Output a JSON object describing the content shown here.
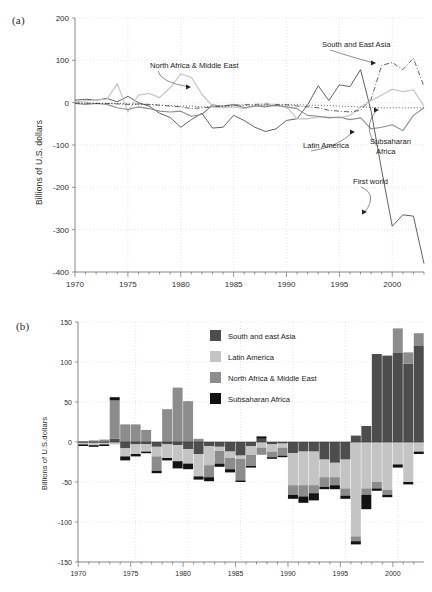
{
  "figure": {
    "panels": [
      {
        "id": "a",
        "label": "(a)",
        "ylabel": "Billions of U.S. dollars"
      },
      {
        "id": "b",
        "label": "(b)",
        "ylabel": "Billions of U.S.dollars"
      }
    ]
  },
  "chart_data": [
    {
      "type": "line",
      "panel": "(a)",
      "title": "",
      "xlabel": "",
      "ylabel": "Billions of U.S. dollars",
      "xlim": [
        1970,
        2003
      ],
      "ylim": [
        -400,
        200
      ],
      "yticks": [
        -400,
        -300,
        -200,
        -100,
        0,
        100,
        200
      ],
      "xticks": [
        1970,
        1975,
        1980,
        1985,
        1990,
        1995,
        2000
      ],
      "grid": true,
      "legend_position": "annotations-inline",
      "annotations": [
        {
          "text": "North Africa & Middle East",
          "x": 1979,
          "y": 45
        },
        {
          "text": "South and East Asia",
          "x": 1997.5,
          "y": 102
        },
        {
          "text": "Latin America",
          "x": 1996,
          "y": -63
        },
        {
          "text": "Subsaharan Africa",
          "x": 2000.5,
          "y": -12
        },
        {
          "text": "First world",
          "x": 2000,
          "y": -247
        }
      ],
      "x": [
        1970,
        1971,
        1972,
        1973,
        1974,
        1975,
        1976,
        1977,
        1978,
        1979,
        1980,
        1981,
        1982,
        1983,
        1984,
        1985,
        1986,
        1987,
        1988,
        1989,
        1990,
        1991,
        1992,
        1993,
        1994,
        1995,
        1996,
        1997,
        1998,
        1999,
        2000,
        2001,
        2002,
        2003
      ],
      "series": [
        {
          "name": "First world",
          "style": "solid",
          "values": [
            6,
            8,
            6,
            10,
            2,
            15,
            0,
            -8,
            -25,
            -35,
            -58,
            -40,
            -25,
            -60,
            -58,
            -30,
            -42,
            -58,
            -68,
            -62,
            -42,
            -38,
            -5,
            40,
            5,
            42,
            38,
            78,
            -20,
            -160,
            -292,
            -265,
            -268,
            -380
          ]
        },
        {
          "name": "North Africa & Middle East",
          "style": "solid-light",
          "values": [
            2,
            4,
            6,
            8,
            45,
            -22,
            18,
            22,
            12,
            35,
            68,
            60,
            20,
            -8,
            -12,
            -10,
            -14,
            -8,
            -5,
            -8,
            -10,
            -38,
            -38,
            -34,
            -34,
            -36,
            -30,
            -10,
            5,
            18,
            32,
            26,
            30,
            -8
          ]
        },
        {
          "name": "Latin America",
          "style": "solid-gray",
          "values": [
            -2,
            -4,
            -2,
            -4,
            -12,
            -16,
            -10,
            -14,
            -20,
            -22,
            -20,
            -32,
            -28,
            -5,
            -8,
            -4,
            -12,
            -8,
            -10,
            -6,
            -10,
            -14,
            -30,
            -32,
            -36,
            -34,
            -40,
            -36,
            -62,
            -58,
            -52,
            -66,
            -30,
            -12
          ]
        },
        {
          "name": "South and East Asia",
          "style": "dashdot",
          "values": [
            -1,
            -1,
            -2,
            -2,
            -3,
            -4,
            -3,
            -4,
            -6,
            -8,
            -10,
            -14,
            -12,
            -10,
            -8,
            -6,
            -5,
            -4,
            -3,
            -4,
            -5,
            -8,
            -10,
            -12,
            -18,
            -20,
            -22,
            -18,
            8,
            88,
            95,
            78,
            105,
            38
          ]
        },
        {
          "name": "Subsaharan Africa",
          "style": "dotted",
          "values": [
            -1,
            -1,
            -1,
            -2,
            -2,
            -3,
            -4,
            -5,
            -6,
            -7,
            -8,
            -8,
            -10,
            -10,
            -9,
            -8,
            -7,
            -6,
            -6,
            -6,
            -5,
            -5,
            -6,
            -6,
            -7,
            -8,
            -9,
            -10,
            -11,
            -12,
            -12,
            -12,
            -12,
            -12
          ]
        }
      ]
    },
    {
      "type": "bar",
      "subtype": "stacked",
      "panel": "(b)",
      "title": "",
      "xlabel": "",
      "ylabel": "Billions of U.S.dollars",
      "xlim": [
        1970,
        2002
      ],
      "ylim": [
        -150,
        150
      ],
      "yticks": [
        -150,
        -100,
        -50,
        0,
        50,
        100,
        150
      ],
      "xticks": [
        1970,
        1975,
        1980,
        1985,
        1990,
        1995,
        2000
      ],
      "grid": true,
      "legend_position": "top-center",
      "categories": [
        1970,
        1971,
        1972,
        1973,
        1974,
        1975,
        1976,
        1977,
        1978,
        1979,
        1980,
        1981,
        1982,
        1983,
        1984,
        1985,
        1986,
        1987,
        1988,
        1989,
        1990,
        1991,
        1992,
        1993,
        1994,
        1995,
        1996,
        1997,
        1998,
        1999,
        2000,
        2001,
        2002
      ],
      "series": [
        {
          "name": "South and east Asia",
          "color": "#4d4d4d",
          "values": [
            -1,
            -1,
            -1,
            4,
            -8,
            -3,
            -3,
            -6,
            -3,
            -4,
            -9,
            -15,
            -5,
            -6,
            -12,
            -17,
            -5,
            4,
            -3,
            -2,
            -14,
            -12,
            -12,
            -22,
            -26,
            -22,
            8,
            20,
            110,
            108,
            112,
            98,
            120
          ]
        },
        {
          "name": "Latin America",
          "color": "#c4c4c4",
          "values": [
            -2,
            -3,
            -2,
            -3,
            -10,
            -12,
            -9,
            -12,
            -17,
            -20,
            -18,
            -28,
            -24,
            -5,
            -8,
            -4,
            -11,
            -7,
            -9,
            -5,
            -40,
            -42,
            -42,
            -22,
            -18,
            -36,
            -118,
            -58,
            -50,
            -60,
            -28,
            -50,
            -12
          ]
        },
        {
          "name": "North Africa & Middle East",
          "color": "#8c8c8c",
          "values": [
            1,
            2,
            3,
            48,
            22,
            22,
            15,
            -18,
            41,
            68,
            51,
            4,
            -15,
            -16,
            -14,
            -27,
            -14,
            -9,
            -7,
            -10,
            -12,
            -14,
            -10,
            -12,
            -10,
            -9,
            -6,
            -8,
            -8,
            -6,
            30,
            14,
            16
          ]
        },
        {
          "name": "Subsaharan Africa",
          "color": "#121212",
          "values": [
            -2,
            -2,
            -2,
            4,
            -5,
            -3,
            -2,
            -3,
            -3,
            -9,
            -7,
            -4,
            -5,
            -4,
            -4,
            -2,
            -2,
            3,
            -2,
            -2,
            -5,
            -8,
            -9,
            -3,
            -5,
            -4,
            -4,
            -18,
            -3,
            -3,
            -4,
            -3,
            -3
          ]
        }
      ],
      "legend": [
        {
          "label": "South and east Asia",
          "color": "#4d4d4d"
        },
        {
          "label": "Latin America",
          "color": "#c4c4c4"
        },
        {
          "label": "North Africa & Middle East",
          "color": "#8c8c8c"
        },
        {
          "label": "Subsaharan Africa",
          "color": "#121212"
        }
      ]
    }
  ]
}
